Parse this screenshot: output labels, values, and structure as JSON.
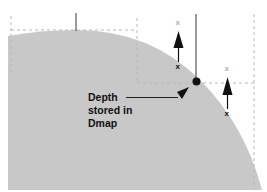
{
  "diagram": {
    "type": "depth-map-surface-illustration",
    "colors": {
      "background": "#ffffff",
      "surface": "#c8c8c8",
      "line": "#222222",
      "dashed": "#b8b8b8",
      "faded_mark": "#b0b0b0",
      "mark": "#111111"
    },
    "label": {
      "line1": "Depth",
      "line2": "stored in",
      "line3": "Dmap"
    },
    "marks": {
      "sample_mark": "x",
      "projected_mark": "x"
    },
    "elements": [
      {
        "name": "surface",
        "shape": "quarter-circle"
      },
      {
        "name": "sample-point",
        "shape": "dot"
      },
      {
        "name": "depth-arrow-1",
        "shape": "up-arrow"
      },
      {
        "name": "depth-arrow-2",
        "shape": "up-arrow"
      }
    ]
  }
}
